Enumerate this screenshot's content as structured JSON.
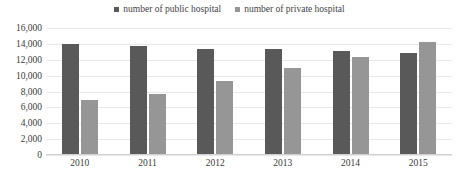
{
  "chart_data": {
    "type": "bar",
    "title": "",
    "xlabel": "",
    "ylabel": "",
    "categories": [
      "2010",
      "2011",
      "2012",
      "2013",
      "2014",
      "2015"
    ],
    "series": [
      {
        "name": "number of public hospital",
        "color": "#595959",
        "values": [
          14000,
          13700,
          13400,
          13300,
          13100,
          12900
        ]
      },
      {
        "name": "number of private hospital",
        "color": "#969696",
        "values": [
          6900,
          7700,
          9300,
          11000,
          12300,
          14200
        ]
      }
    ],
    "ylim": [
      0,
      16000
    ],
    "ytick_labels": [
      "16,000",
      "14,000",
      "12,000",
      "10,000",
      "8,000",
      "6,000",
      "4,000",
      "2,000",
      "0"
    ],
    "ytick_values": [
      16000,
      14000,
      12000,
      10000,
      8000,
      6000,
      4000,
      2000,
      0
    ],
    "grid": true,
    "legend_position": "top-center"
  },
  "legend": {
    "items": [
      {
        "label": "number of public hospital",
        "color": "#595959"
      },
      {
        "label": "number of private hospital",
        "color": "#969696"
      }
    ]
  },
  "colors": {
    "public": "#595959",
    "private": "#969696",
    "gridline": "#e8e8e8",
    "text": "#3a3a3a",
    "background": "#ffffff"
  }
}
